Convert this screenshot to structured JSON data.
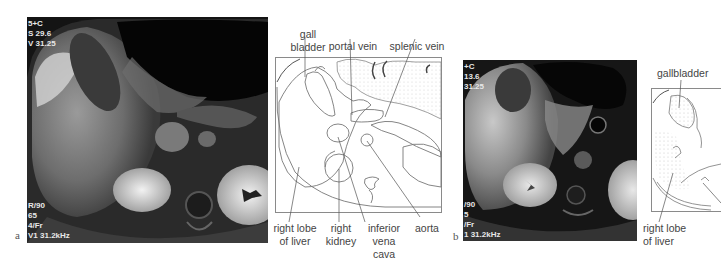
{
  "figure": {
    "panels": [
      {
        "letter": "a",
        "mri_overlay": {
          "top_left": [
            "5+C",
            "S 29.6",
            "V 31.25"
          ],
          "bottom_left": [
            "R/90",
            "65",
            "4/Fr",
            "V1 31.2kHz"
          ]
        },
        "diagram_labels": {
          "gall_bladder_line1": "gall",
          "gall_bladder_line2": "bladder",
          "portal_vein": "portal vein",
          "splenic_vein": "splenic vein",
          "right_lobe_line1": "right lobe",
          "right_lobe_line2": "of liver",
          "right_kidney_line1": "right",
          "right_kidney_line2": "kidney",
          "ivc_line1": "inferior",
          "ivc_line2": "vena cava",
          "aorta": "aorta"
        }
      },
      {
        "letter": "b",
        "mri_overlay": {
          "top_left": [
            "+C",
            "13.6",
            "31.25"
          ],
          "bottom_left": [
            "/90",
            "5",
            "/Fr",
            "1 31.2kHz"
          ]
        },
        "diagram_labels": {
          "gallbladder": "gallbladder",
          "right_lobe_line1": "right lobe",
          "right_lobe_line2": "of liver"
        }
      }
    ],
    "colors": {
      "line": "#7a7a7a",
      "label_text": "#444444",
      "stipple": "#d9d9d9",
      "mri_bg": "#111111"
    }
  }
}
